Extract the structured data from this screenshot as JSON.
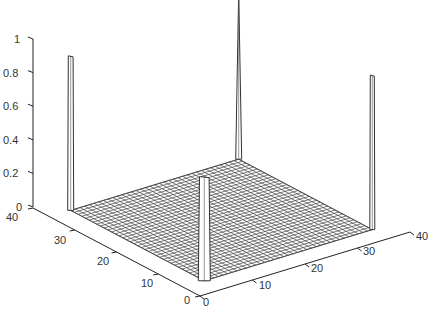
{
  "chart_data": {
    "type": "surface3d",
    "title": "",
    "xlabel": "",
    "ylabel": "",
    "zlabel": "",
    "x_ticks": [
      "0",
      "10",
      "20",
      "30",
      "40"
    ],
    "y_ticks": [
      "0",
      "10",
      "20",
      "30",
      "40"
    ],
    "z_ticks": [
      "0",
      "0.2",
      "0.4",
      "0.6",
      "0.8",
      "1"
    ],
    "xlim": [
      0,
      40
    ],
    "ylim": [
      0,
      40
    ],
    "zlim": [
      0,
      1
    ],
    "grid_size": [
      36,
      36
    ],
    "base_value": 0,
    "peaks": [
      {
        "name": "back-left-corner",
        "x": 1,
        "y": 36,
        "z": 0.92
      },
      {
        "name": "front-corner",
        "x": 1,
        "y": 1,
        "z": 0.62
      },
      {
        "name": "back-corner",
        "x": 36,
        "y": 36,
        "z": 1.0
      },
      {
        "name": "right-corner",
        "x": 36,
        "y": 1,
        "z": 0.92
      }
    ]
  },
  "axes": {
    "z": {
      "ticks": [
        {
          "label": "1",
          "x": 14,
          "y": 43
        },
        {
          "label": "0.8",
          "x": 3,
          "y": 77
        },
        {
          "label": "0.6",
          "x": 3,
          "y": 110
        },
        {
          "label": "0.4",
          "x": 3,
          "y": 144
        },
        {
          "label": "0.2",
          "x": 3,
          "y": 177
        },
        {
          "label": "0",
          "x": 16,
          "y": 211
        }
      ]
    },
    "y": {
      "ticks": [
        {
          "label": "40",
          "x": 6,
          "y": 221
        },
        {
          "label": "30",
          "x": 54,
          "y": 244
        },
        {
          "label": "20",
          "x": 97,
          "y": 265
        },
        {
          "label": "10",
          "x": 141,
          "y": 287
        },
        {
          "label": "0",
          "x": 184,
          "y": 304
        }
      ]
    },
    "x": {
      "ticks": [
        {
          "label": "0",
          "x": 203,
          "y": 306
        },
        {
          "label": "10",
          "x": 259,
          "y": 289
        },
        {
          "label": "20",
          "x": 311,
          "y": 272
        },
        {
          "label": "30",
          "x": 363,
          "y": 255
        },
        {
          "label": "40",
          "x": 416,
          "y": 240
        }
      ]
    }
  }
}
